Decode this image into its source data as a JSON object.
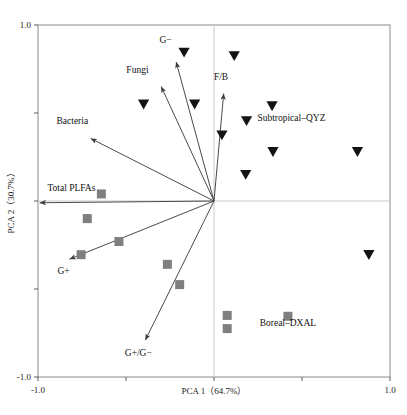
{
  "chart_data": {
    "type": "scatter",
    "title": "",
    "subtitle": "",
    "xlabel": "PCA 1（64.7%）",
    "ylabel": "PCA 2（30.7%）",
    "xlim": [
      -1.0,
      1.0
    ],
    "ylim": [
      -1.0,
      1.0
    ],
    "x_ticklabels": [
      "-1.0",
      "1.0"
    ],
    "y_ticklabels": [
      "1.0",
      "-1.0"
    ],
    "x_tick_values": [
      -1.0,
      1.0
    ],
    "y_tick_values": [
      1.0,
      -1.0
    ],
    "grid": false,
    "legend_position": "none",
    "variance_explained": {
      "pc1": "64.7%",
      "pc2": "30.7%"
    },
    "annotations": [
      {
        "text": "Subtropical–QYZ",
        "x": 0.44,
        "y": 0.455
      },
      {
        "text": "Boreal–DXAL",
        "x": 0.42,
        "y": -0.71
      }
    ],
    "vectors": [
      {
        "name": "G-",
        "label": "G−",
        "x": -0.215,
        "y": 0.79,
        "label_x": -0.275,
        "label_y": 0.9
      },
      {
        "name": "Fungi",
        "label": "Fungi",
        "x": -0.3,
        "y": 0.65,
        "label_x": -0.435,
        "label_y": 0.725
      },
      {
        "name": "Bacteria",
        "label": "Bacteria",
        "x": -0.7,
        "y": 0.355,
        "label_x": -0.805,
        "label_y": 0.435
      },
      {
        "name": "Total PLFAs",
        "label": "Total PLFAs",
        "x": -0.99,
        "y": -0.01,
        "label_x": -0.81,
        "label_y": 0.055
      },
      {
        "name": "G+",
        "label": "G+",
        "x": -0.82,
        "y": -0.33,
        "label_x": -0.855,
        "label_y": -0.415
      },
      {
        "name": "G+/G-",
        "label": "G+/G−",
        "x": -0.39,
        "y": -0.79,
        "label_x": -0.43,
        "label_y": -0.88
      },
      {
        "name": "F/B",
        "label": "F/B",
        "x": 0.055,
        "y": 0.61,
        "label_x": 0.04,
        "label_y": 0.69
      }
    ],
    "series": [
      {
        "name": "Subtropical–QYZ",
        "marker": "triangle-down",
        "color": "#141414",
        "points": [
          {
            "x": -0.17,
            "y": 0.845
          },
          {
            "x": 0.115,
            "y": 0.825
          },
          {
            "x": -0.4,
            "y": 0.55
          },
          {
            "x": -0.11,
            "y": 0.55
          },
          {
            "x": 0.33,
            "y": 0.54
          },
          {
            "x": 0.185,
            "y": 0.455
          },
          {
            "x": 0.045,
            "y": 0.375
          },
          {
            "x": 0.335,
            "y": 0.28
          },
          {
            "x": 0.815,
            "y": 0.28
          },
          {
            "x": 0.18,
            "y": 0.15
          },
          {
            "x": 0.88,
            "y": -0.305
          }
        ]
      },
      {
        "name": "Boreal–DXAL",
        "marker": "square",
        "color": "#7f7f7f",
        "points": [
          {
            "x": -0.64,
            "y": 0.04
          },
          {
            "x": -0.72,
            "y": -0.1
          },
          {
            "x": -0.54,
            "y": -0.23
          },
          {
            "x": -0.755,
            "y": -0.305
          },
          {
            "x": -0.265,
            "y": -0.36
          },
          {
            "x": -0.195,
            "y": -0.475
          },
          {
            "x": 0.075,
            "y": -0.65
          },
          {
            "x": 0.075,
            "y": -0.725
          },
          {
            "x": 0.42,
            "y": -0.655
          }
        ]
      }
    ]
  },
  "figure": {
    "x_axis_label": "PCA 1（64.7%）",
    "y_axis_label": "PCA 2（30.7%）",
    "x_tick_min": "-1.0",
    "x_tick_max": "1.0",
    "y_tick_max": "1.0",
    "y_tick_min": "-1.0"
  }
}
